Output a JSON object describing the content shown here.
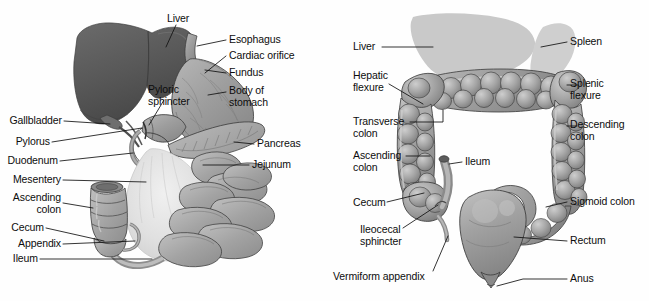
{
  "figure": {
    "background_color": "#fefefe",
    "text_color": "#0d0d0d",
    "leader_line_color": "#111111"
  },
  "palette": {
    "liver_dark": "#5d5d5d",
    "liver_dark_shadow": "#4a4a4a",
    "liver_silhouette": "#c9c9c9",
    "spleen_silhouette": "#cfcfcf",
    "organ_mid_gray": "#9b9b9b",
    "organ_light_gray": "#b9b9b9",
    "organ_highlight": "#d2d2d2",
    "mesentery_pale": "#e2e2e2",
    "outline": "#3a3a3a"
  },
  "panels": [
    {
      "id": "gi-tract",
      "name": "upper-gi-tract-diagram",
      "labels_left": [
        {
          "key": "gallbladder",
          "text": "Gallbladder",
          "x": 8,
          "y": 117
        },
        {
          "key": "pylorus",
          "text": "Pylorus",
          "x": 8,
          "y": 138
        },
        {
          "key": "duodenum",
          "text": "Duodenum",
          "x": 8,
          "y": 157
        },
        {
          "key": "mesentery",
          "text": "Mesentery",
          "x": 8,
          "y": 176
        },
        {
          "key": "ascending_colon",
          "text": "Ascending\ncolon",
          "x": 8,
          "y": 196
        },
        {
          "key": "cecum",
          "text": "Cecum",
          "x": 8,
          "y": 224
        },
        {
          "key": "appendix",
          "text": "Appendix",
          "x": 8,
          "y": 240
        },
        {
          "key": "ileum",
          "text": "Ileum",
          "x": 8,
          "y": 255
        }
      ],
      "labels_right": [
        {
          "key": "esophagus",
          "text": "Esophagus",
          "x": 229,
          "y": 36
        },
        {
          "key": "cardiac_orifice",
          "text": "Cardiac orifice",
          "x": 229,
          "y": 52
        },
        {
          "key": "fundus",
          "text": "Fundus",
          "x": 229,
          "y": 69
        },
        {
          "key": "body_of_stomach",
          "text": "Body of\nstomach",
          "x": 229,
          "y": 86
        },
        {
          "key": "pancreas",
          "text": "Pancreas",
          "x": 257,
          "y": 140
        },
        {
          "key": "jejunum",
          "text": "Jejunum",
          "x": 252,
          "y": 161
        }
      ],
      "labels_free": [
        {
          "key": "liver",
          "text": "Liver",
          "x": 167,
          "y": 13
        },
        {
          "key": "pyloric_sphincter",
          "text": "Pyloric\nsphincter",
          "x": 148,
          "y": 84
        }
      ]
    },
    {
      "id": "large-intestine",
      "name": "large-intestine-diagram",
      "labels_left": [
        {
          "key": "liver",
          "text": "Liver",
          "x": 28,
          "y": 43
        },
        {
          "key": "hepatic_flexure",
          "text": "Hepatic\nflexure",
          "x": 28,
          "y": 72
        },
        {
          "key": "transverse_colon",
          "text": "Transverse\ncolon",
          "x": 28,
          "y": 118
        },
        {
          "key": "ascending_colon",
          "text": "Ascending\ncolon",
          "x": 28,
          "y": 152
        },
        {
          "key": "cecum",
          "text": "Cecum",
          "x": 28,
          "y": 199
        },
        {
          "key": "ileocecal_sphincter",
          "text": "Ileocecal\nsphincter",
          "x": 35,
          "y": 226
        },
        {
          "key": "vermiform_appendix",
          "text": "Vermiform appendix",
          "x": 8,
          "y": 273
        }
      ],
      "labels_right": [
        {
          "key": "spleen",
          "text": "Spleen",
          "x": 245,
          "y": 38
        },
        {
          "key": "splenic_flexure",
          "text": "Splenic\nflexure",
          "x": 245,
          "y": 80
        },
        {
          "key": "descending_colon",
          "text": "Descending\ncolon",
          "x": 245,
          "y": 121
        },
        {
          "key": "sigmoid_colon",
          "text": "Sigmoid colon",
          "x": 245,
          "y": 198
        },
        {
          "key": "rectum",
          "text": "Rectum",
          "x": 245,
          "y": 237
        },
        {
          "key": "anus",
          "text": "Anus",
          "x": 245,
          "y": 275
        }
      ],
      "labels_free": [
        {
          "key": "ileum",
          "text": "Ileum",
          "x": 140,
          "y": 158
        }
      ]
    }
  ]
}
